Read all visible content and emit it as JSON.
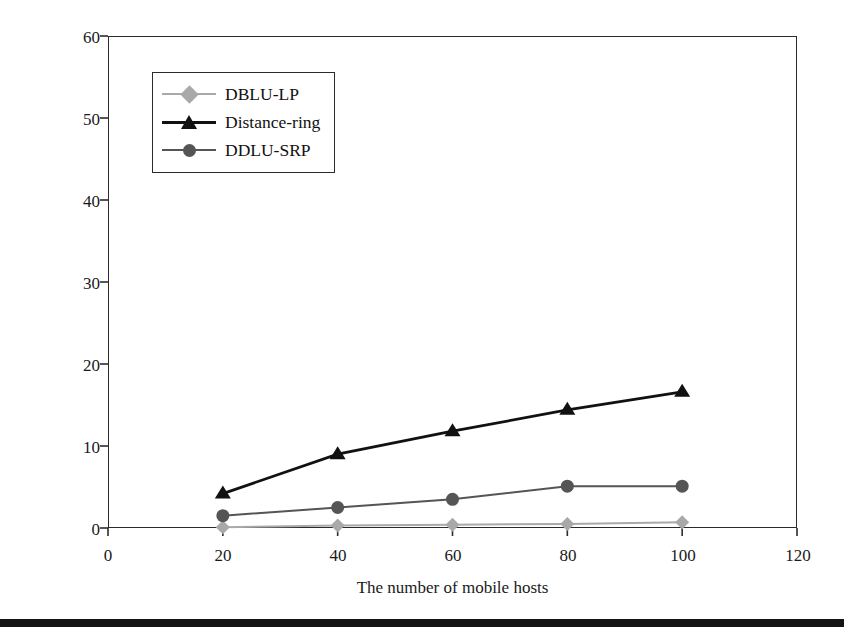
{
  "chart_data": {
    "type": "line",
    "title": "",
    "subtitle": "",
    "xlabel": "The number of mobile hosts",
    "ylabel": "Paging signals per unit time",
    "x": [
      20,
      40,
      60,
      80,
      100
    ],
    "xlim": [
      0,
      120
    ],
    "ylim": [
      0,
      60
    ],
    "xticks": [
      "0",
      "20",
      "40",
      "60",
      "80",
      "100",
      "120"
    ],
    "yticks": [
      "0",
      "10",
      "20",
      "30",
      "40",
      "50",
      "60"
    ],
    "xtick_values": [
      0,
      20,
      40,
      60,
      80,
      100,
      120
    ],
    "ytick_values": [
      0,
      10,
      20,
      30,
      40,
      50,
      60
    ],
    "grid": false,
    "legend_position": "upper left",
    "series": [
      {
        "name": "DBLU-LP",
        "marker": "diamond",
        "color": "#a9a9a9",
        "values": [
          0.1,
          0.3,
          0.4,
          0.5,
          0.7
        ]
      },
      {
        "name": "Distance-ring",
        "marker": "triangle",
        "color": "#111111",
        "values": [
          4.2,
          9.0,
          11.8,
          14.4,
          16.6
        ]
      },
      {
        "name": "DDLU-SRP",
        "marker": "circle",
        "color": "#555555",
        "values": [
          1.5,
          2.5,
          3.5,
          5.1,
          5.1
        ]
      }
    ]
  },
  "figure": {
    "axis_color": "#2b2b2b",
    "background": "#ffffff",
    "bottom_rule_color": "#141414"
  }
}
